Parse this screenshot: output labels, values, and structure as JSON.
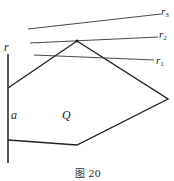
{
  "figure": {
    "caption": "图 20",
    "labels": {
      "r": "r",
      "a": "a",
      "Q": "Q",
      "r1": "r",
      "r1_sub": "1",
      "r2": "r",
      "r2_sub": "2",
      "r3": "r",
      "r3_sub": "3"
    },
    "colors": {
      "stroke": "#222222",
      "background": "#ffffff"
    }
  }
}
